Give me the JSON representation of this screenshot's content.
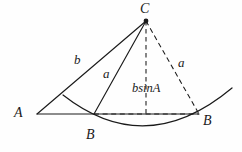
{
  "figure": {
    "background_color": "#fefefe",
    "stroke_color": "#1a1a1a",
    "points": {
      "A": {
        "x": 37,
        "y": 114
      },
      "C": {
        "x": 146,
        "y": 21
      },
      "B1": {
        "x": 94,
        "y": 114
      },
      "B2": {
        "x": 199,
        "y": 114
      },
      "foot": {
        "x": 146,
        "y": 114
      }
    },
    "solid_segments": [
      {
        "name": "segment-A-C",
        "from": "A",
        "to": "C"
      },
      {
        "name": "segment-A-B2-baseline",
        "from": "A",
        "to": "B2"
      },
      {
        "name": "segment-B1-C",
        "from": "B1",
        "to": "C"
      }
    ],
    "dashed_segments": [
      {
        "name": "segment-C-B2",
        "from": "C",
        "to": "B2"
      },
      {
        "name": "segment-C-foot-altitude",
        "from": "C",
        "to": "foot"
      },
      {
        "name": "segment-B1-B2-dashed-base",
        "from": "B1",
        "to": "B2"
      }
    ],
    "arc": {
      "name": "arc-radius-a-centered-at-C",
      "start": {
        "x": 63,
        "y": 95
      },
      "end": {
        "x": 232,
        "y": 88
      },
      "sag_point": {
        "x": 146,
        "y": 137
      }
    },
    "vertex_marker": {
      "at": "C",
      "radius": 2.4
    }
  },
  "labels": {
    "vertex_A": {
      "text": "A",
      "x": 14,
      "y": 106
    },
    "vertex_C": {
      "text": "C",
      "x": 140,
      "y": 2
    },
    "vertex_B1": {
      "text": "B",
      "x": 86,
      "y": 128
    },
    "vertex_B2": {
      "text": "B",
      "x": 203,
      "y": 114
    },
    "side_b": {
      "text": "b",
      "x": 74,
      "y": 53
    },
    "side_a_left": {
      "text": "a",
      "x": 103,
      "y": 67
    },
    "side_a_right": {
      "text": "a",
      "x": 178,
      "y": 56
    },
    "altitude": {
      "text": "bsinA",
      "x": 132,
      "y": 82
    }
  },
  "colors": {
    "ink": "#1a1a1a",
    "paper": "#fefefe"
  }
}
